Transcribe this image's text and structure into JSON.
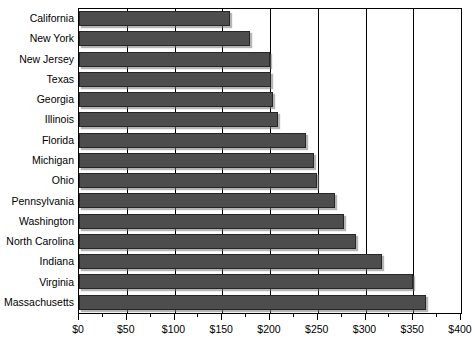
{
  "chart_data": {
    "type": "bar",
    "orientation": "horizontal",
    "title": "",
    "xlabel": "",
    "ylabel": "",
    "xlim": [
      0,
      400
    ],
    "ylim": null,
    "grid": true,
    "legend": null,
    "tick_prefix": "$",
    "tick_step": 50,
    "minor_tick_step": 25,
    "tick_labels": [
      "$0",
      "$50",
      "$100",
      "$150",
      "$200",
      "$250",
      "$300",
      "$350",
      "$400"
    ],
    "tick_values": [
      0,
      50,
      100,
      150,
      200,
      250,
      300,
      350,
      400
    ],
    "categories": [
      "California",
      "New York",
      "New Jersey",
      "Texas",
      "Georgia",
      "Illinois",
      "Florida",
      "Michigan",
      "Ohio",
      "Pennsylvania",
      "Washington",
      "North Carolina",
      "Indiana",
      "Virginia",
      "Massachusetts"
    ],
    "values": [
      158,
      179,
      200,
      201,
      203,
      208,
      238,
      246,
      249,
      268,
      277,
      290,
      317,
      350,
      363
    ],
    "bar_color": "#4d4d4d",
    "bar_border_color": "#262626",
    "gridline_color": "#000000",
    "axis_color": "#000000",
    "background_color": "#ffffff"
  }
}
